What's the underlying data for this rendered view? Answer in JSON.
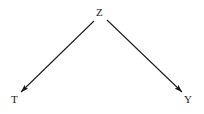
{
  "figure": {
    "kind": "causal-dag",
    "background_color": "#ffffff",
    "stroke_color": "#1a1a1a",
    "label_color": "#1a1a1a"
  },
  "nodes": [
    {
      "id": "z",
      "label": "Z",
      "x": 101,
      "y": 12
    },
    {
      "id": "t",
      "label": "T",
      "x": 15,
      "y": 99
    },
    {
      "id": "y",
      "label": "Y",
      "x": 188,
      "y": 99
    }
  ],
  "edges": [
    {
      "id": "z-to-t",
      "from": "Z",
      "to": "T",
      "arrowhead": "filled-triangle",
      "x1": 94,
      "y1": 21,
      "x2": 21,
      "y2": 92
    },
    {
      "id": "z-to-y",
      "from": "Z",
      "to": "Y",
      "arrowhead": "filled-triangle",
      "x1": 107,
      "y1": 20,
      "x2": 182,
      "y2": 92
    }
  ]
}
